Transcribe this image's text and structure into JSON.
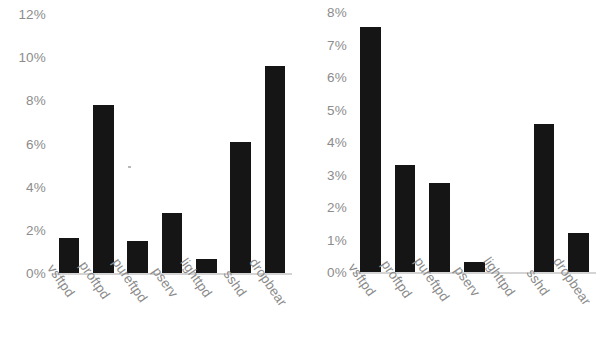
{
  "figure": {
    "background_color": "#ffffff",
    "bar_color": "#151515",
    "axis_text_color": "#8c8c8c",
    "baseline_color": "#d4d4d4"
  },
  "chart_data": [
    {
      "type": "bar",
      "panel": "left",
      "title": "",
      "xlabel": "",
      "ylabel": "",
      "categories": [
        "vsftpd",
        "proftpd",
        "pureftpd",
        "pserv",
        "lighttpd",
        "sshd",
        "dropbear"
      ],
      "values": [
        1.6,
        7.8,
        1.5,
        2.8,
        0.65,
        6.05,
        9.6
      ],
      "ylim": [
        0,
        12
      ],
      "yticks": [
        0,
        2,
        4,
        6,
        8,
        10,
        12
      ],
      "ytick_labels": [
        "0%",
        "2%",
        "4%",
        "6%",
        "8%",
        "10%",
        "12%"
      ],
      "grid": false,
      "legend": "none"
    },
    {
      "type": "bar",
      "panel": "right",
      "title": "",
      "xlabel": "",
      "ylabel": "",
      "categories": [
        "vsftpd",
        "proftpd",
        "pureftpd",
        "pserv",
        "lighttpd",
        "sshd",
        "dropbear"
      ],
      "values": [
        7.55,
        3.3,
        2.75,
        0.3,
        0.0,
        4.55,
        1.2
      ],
      "ylim": [
        0,
        8
      ],
      "yticks": [
        0,
        1,
        2,
        3,
        4,
        5,
        6,
        7,
        8
      ],
      "ytick_labels": [
        "0%",
        "1%",
        "2%",
        "3%",
        "4%",
        "5%",
        "6%",
        "7%",
        "8%"
      ],
      "grid": false,
      "legend": "none"
    }
  ]
}
